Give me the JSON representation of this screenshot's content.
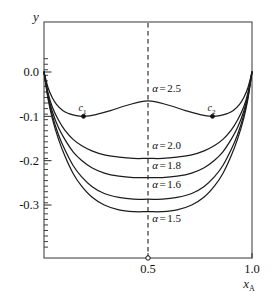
{
  "chart_data": {
    "type": "line",
    "title": "",
    "xlabel": "x_A",
    "ylabel": "y",
    "xlabel_base": "x",
    "xlabel_subscript": "A",
    "xlim": [
      0.0,
      1.0
    ],
    "ylim": [
      -0.36,
      0.03
    ],
    "grid": false,
    "legend": "inline-curve-labels",
    "x_ticks": [
      {
        "value": 0.5,
        "label": "0.5"
      },
      {
        "value": 1.0,
        "label": "1.0"
      }
    ],
    "y_ticks": [
      {
        "value": 0.0,
        "label": "0.0"
      },
      {
        "value": -0.1,
        "label": "-0.1"
      },
      {
        "value": -0.2,
        "label": "-0.2"
      },
      {
        "value": -0.3,
        "label": "-0.3"
      }
    ],
    "y_minor_tick_step": 0.0125,
    "annotations": [
      {
        "name": "c1",
        "base": "c",
        "subscript": "1",
        "x": 0.19,
        "y": -0.1,
        "marker": "filled-dot"
      },
      {
        "name": "c2",
        "base": "c",
        "subscript": "2",
        "x": 0.81,
        "y": -0.1,
        "marker": "filled-dot"
      },
      {
        "name": "x-half-marker",
        "x": 0.5,
        "y": -0.36,
        "marker": "open-circle"
      }
    ],
    "reference_lines": [
      {
        "name": "x-half-dashed",
        "orientation": "vertical",
        "x": 0.5,
        "style": "dashed"
      }
    ],
    "series": [
      {
        "name": "alpha-2.5",
        "label": "α = 2.5",
        "alpha_symbol": "α",
        "equals": "=",
        "alpha_value": "2.5",
        "shape": "double-well",
        "minima": [
          {
            "x": 0.19,
            "y": -0.1
          },
          {
            "x": 0.81,
            "y": -0.1
          }
        ],
        "local_max": {
          "x": 0.5,
          "y": -0.065
        },
        "endpoints": [
          {
            "x": 0.0,
            "y": 0.0
          },
          {
            "x": 1.0,
            "y": 0.0
          }
        ],
        "label_x": 0.52,
        "label_y": -0.045,
        "points": [
          {
            "x": 0.0,
            "y": 0.0
          },
          {
            "x": 0.02,
            "y": -0.036
          },
          {
            "x": 0.04,
            "y": -0.058
          },
          {
            "x": 0.06,
            "y": -0.073
          },
          {
            "x": 0.09,
            "y": -0.087
          },
          {
            "x": 0.12,
            "y": -0.094
          },
          {
            "x": 0.15,
            "y": -0.098
          },
          {
            "x": 0.19,
            "y": -0.1
          },
          {
            "x": 0.25,
            "y": -0.096
          },
          {
            "x": 0.32,
            "y": -0.087
          },
          {
            "x": 0.4,
            "y": -0.075
          },
          {
            "x": 0.5,
            "y": -0.065
          },
          {
            "x": 0.6,
            "y": -0.075
          },
          {
            "x": 0.68,
            "y": -0.087
          },
          {
            "x": 0.75,
            "y": -0.096
          },
          {
            "x": 0.81,
            "y": -0.1
          },
          {
            "x": 0.85,
            "y": -0.098
          },
          {
            "x": 0.88,
            "y": -0.094
          },
          {
            "x": 0.91,
            "y": -0.087
          },
          {
            "x": 0.94,
            "y": -0.073
          },
          {
            "x": 0.96,
            "y": -0.058
          },
          {
            "x": 0.98,
            "y": -0.036
          },
          {
            "x": 1.0,
            "y": 0.0
          }
        ]
      },
      {
        "name": "alpha-2.0",
        "label": "α = 2.0",
        "alpha_symbol": "α",
        "equals": "=",
        "alpha_value": "2.0",
        "shape": "single-well",
        "minimum": {
          "x": 0.5,
          "y": -0.195
        },
        "endpoints": [
          {
            "x": 0.0,
            "y": 0.0
          },
          {
            "x": 1.0,
            "y": 0.0
          }
        ],
        "label_x": 0.52,
        "label_y": -0.173,
        "points": [
          {
            "x": 0.0,
            "y": 0.0
          },
          {
            "x": 0.02,
            "y": -0.048
          },
          {
            "x": 0.04,
            "y": -0.079
          },
          {
            "x": 0.07,
            "y": -0.109
          },
          {
            "x": 0.1,
            "y": -0.131
          },
          {
            "x": 0.14,
            "y": -0.152
          },
          {
            "x": 0.18,
            "y": -0.166
          },
          {
            "x": 0.23,
            "y": -0.178
          },
          {
            "x": 0.29,
            "y": -0.187
          },
          {
            "x": 0.36,
            "y": -0.192
          },
          {
            "x": 0.43,
            "y": -0.195
          },
          {
            "x": 0.5,
            "y": -0.195
          },
          {
            "x": 0.57,
            "y": -0.195
          },
          {
            "x": 0.64,
            "y": -0.192
          },
          {
            "x": 0.71,
            "y": -0.187
          },
          {
            "x": 0.77,
            "y": -0.178
          },
          {
            "x": 0.82,
            "y": -0.166
          },
          {
            "x": 0.86,
            "y": -0.152
          },
          {
            "x": 0.9,
            "y": -0.131
          },
          {
            "x": 0.93,
            "y": -0.109
          },
          {
            "x": 0.96,
            "y": -0.079
          },
          {
            "x": 0.98,
            "y": -0.048
          },
          {
            "x": 1.0,
            "y": 0.0
          }
        ]
      },
      {
        "name": "alpha-1.8",
        "label": "α = 1.8",
        "alpha_symbol": "α",
        "equals": "=",
        "alpha_value": "1.8",
        "shape": "single-well",
        "minimum": {
          "x": 0.5,
          "y": -0.238
        },
        "endpoints": [
          {
            "x": 0.0,
            "y": 0.0
          },
          {
            "x": 1.0,
            "y": 0.0
          }
        ],
        "label_x": 0.52,
        "label_y": -0.218,
        "points": [
          {
            "x": 0.0,
            "y": 0.0
          },
          {
            "x": 0.02,
            "y": -0.053
          },
          {
            "x": 0.04,
            "y": -0.089
          },
          {
            "x": 0.07,
            "y": -0.126
          },
          {
            "x": 0.1,
            "y": -0.152
          },
          {
            "x": 0.14,
            "y": -0.18
          },
          {
            "x": 0.18,
            "y": -0.199
          },
          {
            "x": 0.23,
            "y": -0.216
          },
          {
            "x": 0.29,
            "y": -0.228
          },
          {
            "x": 0.36,
            "y": -0.235
          },
          {
            "x": 0.43,
            "y": -0.238
          },
          {
            "x": 0.5,
            "y": -0.238
          },
          {
            "x": 0.57,
            "y": -0.238
          },
          {
            "x": 0.64,
            "y": -0.235
          },
          {
            "x": 0.71,
            "y": -0.228
          },
          {
            "x": 0.77,
            "y": -0.216
          },
          {
            "x": 0.82,
            "y": -0.199
          },
          {
            "x": 0.86,
            "y": -0.18
          },
          {
            "x": 0.9,
            "y": -0.152
          },
          {
            "x": 0.93,
            "y": -0.126
          },
          {
            "x": 0.96,
            "y": -0.089
          },
          {
            "x": 0.98,
            "y": -0.053
          },
          {
            "x": 1.0,
            "y": 0.0
          }
        ]
      },
      {
        "name": "alpha-1.6",
        "label": "α = 1.6",
        "alpha_symbol": "α",
        "equals": "=",
        "alpha_value": "1.6",
        "shape": "single-well",
        "minimum": {
          "x": 0.5,
          "y": -0.287
        },
        "endpoints": [
          {
            "x": 0.0,
            "y": 0.0
          },
          {
            "x": 1.0,
            "y": 0.0
          }
        ],
        "label_x": 0.52,
        "label_y": -0.262,
        "points": [
          {
            "x": 0.0,
            "y": 0.0
          },
          {
            "x": 0.02,
            "y": -0.058
          },
          {
            "x": 0.04,
            "y": -0.098
          },
          {
            "x": 0.07,
            "y": -0.142
          },
          {
            "x": 0.1,
            "y": -0.175
          },
          {
            "x": 0.14,
            "y": -0.211
          },
          {
            "x": 0.18,
            "y": -0.236
          },
          {
            "x": 0.23,
            "y": -0.258
          },
          {
            "x": 0.29,
            "y": -0.274
          },
          {
            "x": 0.36,
            "y": -0.283
          },
          {
            "x": 0.43,
            "y": -0.287
          },
          {
            "x": 0.5,
            "y": -0.287
          },
          {
            "x": 0.57,
            "y": -0.287
          },
          {
            "x": 0.64,
            "y": -0.283
          },
          {
            "x": 0.71,
            "y": -0.274
          },
          {
            "x": 0.77,
            "y": -0.258
          },
          {
            "x": 0.82,
            "y": -0.236
          },
          {
            "x": 0.86,
            "y": -0.211
          },
          {
            "x": 0.9,
            "y": -0.175
          },
          {
            "x": 0.93,
            "y": -0.142
          },
          {
            "x": 0.96,
            "y": -0.098
          },
          {
            "x": 0.98,
            "y": -0.058
          },
          {
            "x": 1.0,
            "y": 0.0
          }
        ]
      },
      {
        "name": "alpha-1.5",
        "label": "α = 1.5",
        "alpha_symbol": "α",
        "equals": "=",
        "alpha_value": "1.5",
        "shape": "single-well",
        "minimum": {
          "x": 0.5,
          "y": -0.315
        },
        "endpoints": [
          {
            "x": 0.0,
            "y": 0.0
          },
          {
            "x": 1.0,
            "y": 0.0
          }
        ],
        "label_x": 0.52,
        "label_y": -0.338,
        "points": [
          {
            "x": 0.0,
            "y": 0.0
          },
          {
            "x": 0.02,
            "y": -0.062
          },
          {
            "x": 0.04,
            "y": -0.105
          },
          {
            "x": 0.07,
            "y": -0.152
          },
          {
            "x": 0.1,
            "y": -0.189
          },
          {
            "x": 0.14,
            "y": -0.229
          },
          {
            "x": 0.18,
            "y": -0.257
          },
          {
            "x": 0.23,
            "y": -0.282
          },
          {
            "x": 0.29,
            "y": -0.3
          },
          {
            "x": 0.36,
            "y": -0.311
          },
          {
            "x": 0.43,
            "y": -0.315
          },
          {
            "x": 0.5,
            "y": -0.315
          },
          {
            "x": 0.57,
            "y": -0.315
          },
          {
            "x": 0.64,
            "y": -0.311
          },
          {
            "x": 0.71,
            "y": -0.3
          },
          {
            "x": 0.77,
            "y": -0.282
          },
          {
            "x": 0.82,
            "y": -0.257
          },
          {
            "x": 0.86,
            "y": -0.229
          },
          {
            "x": 0.9,
            "y": -0.189
          },
          {
            "x": 0.93,
            "y": -0.152
          },
          {
            "x": 0.96,
            "y": -0.105
          },
          {
            "x": 0.98,
            "y": -0.062
          },
          {
            "x": 1.0,
            "y": 0.0
          }
        ]
      }
    ]
  }
}
